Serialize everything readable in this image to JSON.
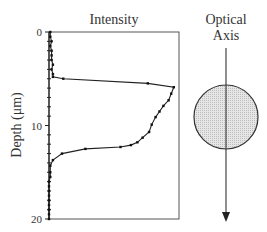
{
  "figure": {
    "plot_title": "Intensity",
    "y_axis_label": "Depth (μm)",
    "y_ticks": [
      {
        "value": 0,
        "label": "0"
      },
      {
        "value": 10,
        "label": "10"
      },
      {
        "value": 20,
        "label": "20"
      }
    ],
    "optical_axis_label_line1": "Optical",
    "optical_axis_label_line2": "Axis"
  },
  "colors": {
    "line": "#222222",
    "frame": "#555555",
    "sphere_fill": "#dcdcdc",
    "sphere_stroke": "#333333",
    "axis_arrow": "#444444"
  },
  "chart_data": {
    "type": "line",
    "title": "Intensity",
    "xlabel": "Intensity",
    "ylabel": "Depth (μm)",
    "ylim": [
      0,
      20
    ],
    "y_inverted": true,
    "xlim": [
      0,
      1
    ],
    "grid": false,
    "series": [
      {
        "name": "Intensity profile",
        "points": [
          {
            "depth": 0.0,
            "intensity": 0.01
          },
          {
            "depth": 0.5,
            "intensity": 0.01
          },
          {
            "depth": 1.0,
            "intensity": 0.02
          },
          {
            "depth": 1.5,
            "intensity": 0.01
          },
          {
            "depth": 2.0,
            "intensity": 0.02
          },
          {
            "depth": 2.5,
            "intensity": 0.02
          },
          {
            "depth": 3.0,
            "intensity": 0.02
          },
          {
            "depth": 3.5,
            "intensity": 0.03
          },
          {
            "depth": 4.0,
            "intensity": 0.02
          },
          {
            "depth": 4.5,
            "intensity": 0.03
          },
          {
            "depth": 4.8,
            "intensity": 0.03
          },
          {
            "depth": 5.0,
            "intensity": 0.11
          },
          {
            "depth": 5.5,
            "intensity": 0.76
          },
          {
            "depth": 5.9,
            "intensity": 0.96
          },
          {
            "depth": 6.6,
            "intensity": 0.94
          },
          {
            "depth": 7.3,
            "intensity": 0.92
          },
          {
            "depth": 7.9,
            "intensity": 0.88
          },
          {
            "depth": 8.5,
            "intensity": 0.85
          },
          {
            "depth": 9.1,
            "intensity": 0.82
          },
          {
            "depth": 9.9,
            "intensity": 0.79
          },
          {
            "depth": 10.7,
            "intensity": 0.77
          },
          {
            "depth": 11.3,
            "intensity": 0.72
          },
          {
            "depth": 11.8,
            "intensity": 0.68
          },
          {
            "depth": 12.1,
            "intensity": 0.63
          },
          {
            "depth": 12.3,
            "intensity": 0.55
          },
          {
            "depth": 12.5,
            "intensity": 0.28
          },
          {
            "depth": 13.0,
            "intensity": 0.1
          },
          {
            "depth": 13.7,
            "intensity": 0.03
          },
          {
            "depth": 14.3,
            "intensity": 0.01
          },
          {
            "depth": 15.0,
            "intensity": 0.01
          },
          {
            "depth": 15.5,
            "intensity": 0.01
          },
          {
            "depth": 16.0,
            "intensity": 0.0
          },
          {
            "depth": 16.5,
            "intensity": 0.0
          },
          {
            "depth": 17.0,
            "intensity": 0.0
          },
          {
            "depth": 17.5,
            "intensity": 0.0
          },
          {
            "depth": 18.0,
            "intensity": 0.0
          },
          {
            "depth": 18.5,
            "intensity": 0.0
          },
          {
            "depth": 19.0,
            "intensity": 0.0
          },
          {
            "depth": 19.5,
            "intensity": 0.0
          },
          {
            "depth": 20.0,
            "intensity": 0.0
          }
        ]
      }
    ],
    "annotations": [
      "Optical Axis"
    ]
  }
}
